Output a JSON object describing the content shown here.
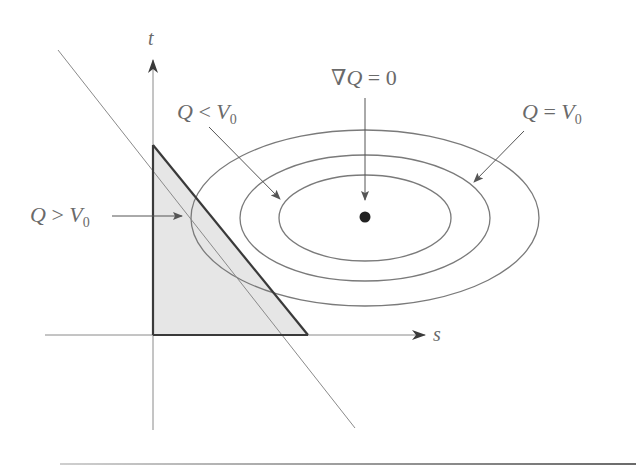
{
  "diagram": {
    "title": "",
    "axes": {
      "horizontal_label": "s",
      "vertical_label": "t"
    },
    "labels": {
      "gradient_zero": {
        "prefix": "∇",
        "var": "Q",
        "rest": " = 0"
      },
      "q_less": {
        "var": "Q",
        "op": " < ",
        "rhs": "V",
        "sub": "0"
      },
      "q_equal": {
        "var": "Q",
        "op": " = ",
        "rhs": "V",
        "sub": "0"
      },
      "q_greater": {
        "var": "Q",
        "op": " > ",
        "rhs": "V",
        "sub": "0"
      }
    },
    "elements": [
      "t-axis (vertical arrow)",
      "s-axis (horizontal arrow)",
      "diagonal constraint line",
      "shaded triangular feasible region",
      "three concentric level-set ellipses",
      "center point where gradient of Q is zero"
    ],
    "colors": {
      "line": "#7a7a7a",
      "dark_line": "#3a3a3a",
      "shade": "#e4e4e4",
      "point": "#222222",
      "text": "#6a6a6a"
    }
  }
}
